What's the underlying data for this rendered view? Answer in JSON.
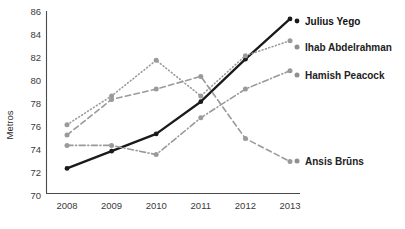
{
  "chart_data": {
    "type": "line",
    "title": "",
    "xlabel": "",
    "ylabel": "Metros",
    "categories": [
      "2008",
      "2009",
      "2010",
      "2011",
      "2012",
      "2013"
    ],
    "x": [
      2008,
      2009,
      2010,
      2011,
      2012,
      2013
    ],
    "ylim": [
      70,
      86
    ],
    "yticks": [
      70,
      72,
      74,
      76,
      78,
      80,
      82,
      84,
      86
    ],
    "ytick_labels": [
      "70",
      "72",
      "74",
      "76",
      "78",
      "80",
      "82",
      "84",
      "86"
    ],
    "grid": false,
    "legend_position": "right",
    "series": [
      {
        "name": "Julius Yego",
        "values": [
          72.4,
          73.9,
          75.4,
          78.2,
          81.9,
          85.4
        ],
        "color": "#1a1a1a",
        "style": "solid",
        "width": 2.3,
        "emphasis": true
      },
      {
        "name": "Ihab Abdelrahman",
        "values": [
          76.2,
          78.7,
          81.8,
          78.7,
          82.2,
          83.5
        ],
        "color": "#9a9a9a",
        "style": "dotted",
        "width": 1.6,
        "emphasis": false
      },
      {
        "name": "Hamish Peacock",
        "values": [
          74.4,
          74.4,
          73.6,
          76.8,
          79.3,
          80.9
        ],
        "color": "#9a9a9a",
        "style": "dashdot",
        "width": 1.6,
        "emphasis": false
      },
      {
        "name": "Ansis Brūns",
        "values": [
          75.3,
          78.4,
          79.3,
          80.4,
          75.0,
          73.0
        ],
        "color": "#9a9a9a",
        "style": "dashed",
        "width": 1.6,
        "emphasis": false
      }
    ]
  },
  "axis": {
    "y_title": "Metros",
    "y_tick_labels": [
      "86",
      "84",
      "82",
      "80",
      "78",
      "76",
      "74",
      "72",
      "70"
    ],
    "x_tick_labels": [
      "2008",
      "2009",
      "2010",
      "2011",
      "2012",
      "2013"
    ]
  },
  "legend": {
    "entries": [
      {
        "label": "Julius Yego",
        "color": "#1a1a1a",
        "bold": true
      },
      {
        "label": "Ihab Abdelrahman",
        "color": "#8f8f8f",
        "bold": true
      },
      {
        "label": "Hamish Peacock",
        "color": "#8f8f8f",
        "bold": true
      },
      {
        "label": "Ansis Brūns",
        "color": "#8f8f8f",
        "bold": true
      }
    ]
  }
}
